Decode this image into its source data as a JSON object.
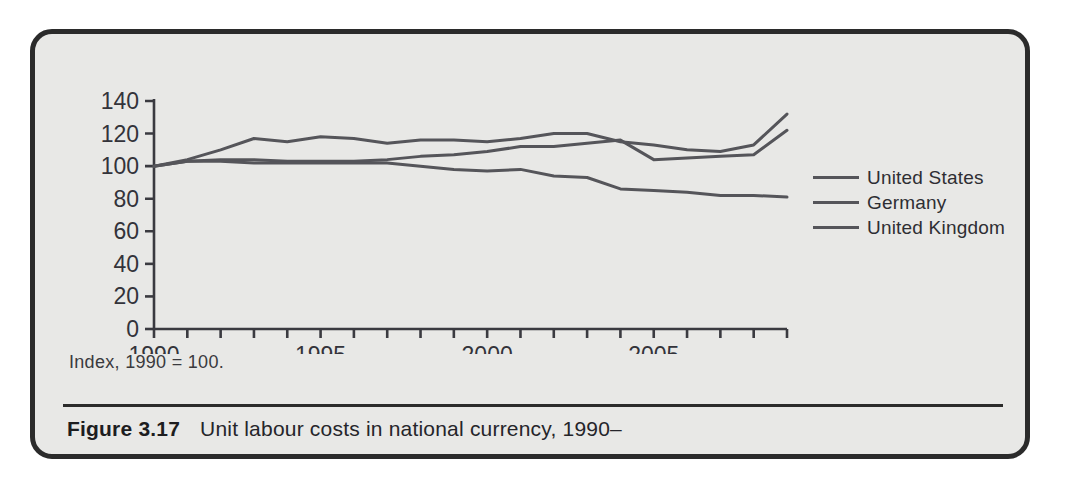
{
  "figure": {
    "caption_number": "Figure 3.17",
    "caption_title": "Unit labour costs in national currency, 1990–",
    "index_note": "Index, 1990 = 100."
  },
  "legend": {
    "items": [
      {
        "label": "United States",
        "color": "#55555a"
      },
      {
        "label": "Germany",
        "color": "#55555a"
      },
      {
        "label": "United Kingdom",
        "color": "#55555a"
      }
    ]
  },
  "chart_data": {
    "type": "line",
    "title": "Unit labour costs in national currency, 1990–",
    "subtitle": "Index, 1990 = 100.",
    "xlabel": "",
    "ylabel": "",
    "xlim": [
      1990,
      2009
    ],
    "ylim": [
      0,
      140
    ],
    "yticks": [
      0,
      20,
      40,
      60,
      80,
      100,
      120,
      140
    ],
    "ytick_labels": [
      "0",
      "20",
      "40",
      "60",
      "80",
      "100",
      "120",
      "140"
    ],
    "x": [
      1990,
      1991,
      1992,
      1993,
      1994,
      1995,
      1996,
      1997,
      1998,
      1999,
      2000,
      2001,
      2002,
      2003,
      2004,
      2005,
      2006,
      2007,
      2008,
      2009
    ],
    "xticks": [
      1990,
      1991,
      1992,
      1993,
      1994,
      1995,
      1996,
      1997,
      1998,
      1999,
      2000,
      2001,
      2002,
      2003,
      2004,
      2005,
      2006,
      2007,
      2008,
      2009
    ],
    "xtick_labels_shown": [
      "1990",
      "1995",
      "2000",
      "2005"
    ],
    "xtick_labels_shown_at": [
      1990,
      1995,
      2000,
      2005
    ],
    "grid": false,
    "legend_position": "right",
    "series": [
      {
        "name": "United States",
        "color": "#55555a",
        "values": [
          100,
          103,
          104,
          104,
          103,
          103,
          103,
          104,
          106,
          107,
          109,
          112,
          112,
          114,
          116,
          104,
          105,
          106,
          107,
          122
        ]
      },
      {
        "name": "Germany",
        "color": "#55555a",
        "values": [
          100,
          104,
          110,
          117,
          115,
          118,
          117,
          114,
          116,
          116,
          115,
          117,
          120,
          120,
          115,
          113,
          110,
          109,
          113,
          132
        ]
      },
      {
        "name": "United Kingdom",
        "color": "#55555a",
        "values": [
          100,
          103,
          103,
          102,
          102,
          102,
          102,
          102,
          100,
          98,
          97,
          98,
          94,
          93,
          86,
          85,
          84,
          82,
          82,
          81
        ]
      }
    ]
  }
}
